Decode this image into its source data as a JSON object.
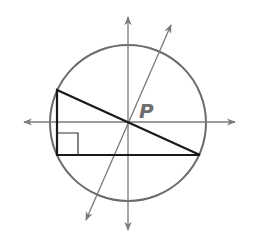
{
  "diagram": {
    "type": "geometry",
    "labels": {
      "center": "P"
    },
    "colors": {
      "background": "#ffffff",
      "circle": "#6b6b6b",
      "axes": "#7a7a7a",
      "triangle": "#1a1a1a",
      "label": "#6e6e6e"
    },
    "circle": {
      "cx": 128,
      "cy": 123,
      "r": 78
    },
    "triangle": {
      "vertices": [
        [
          57,
          90
        ],
        [
          57,
          155
        ],
        [
          200,
          155
        ]
      ],
      "right_angle_at": [
        57,
        155
      ]
    },
    "lines": [
      {
        "name": "vertical-axis",
        "from": [
          128,
          17
        ],
        "to": [
          128,
          230
        ]
      },
      {
        "name": "horizontal-axis",
        "from": [
          24,
          122
        ],
        "to": [
          235,
          122
        ]
      },
      {
        "name": "slanted-line",
        "from": [
          86,
          220
        ],
        "to": [
          171,
          25
        ]
      }
    ]
  }
}
